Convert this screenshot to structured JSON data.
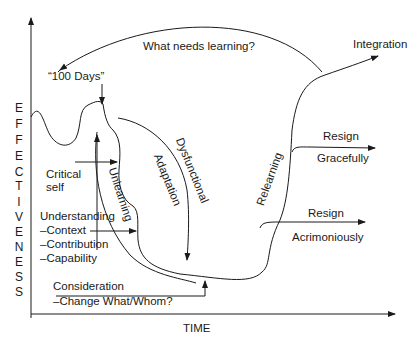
{
  "diagram": {
    "y_axis_label": [
      "E",
      "F",
      "F",
      "E",
      "C",
      "T",
      "I",
      "V",
      "E",
      "N",
      "E",
      "S",
      "S"
    ],
    "x_axis_label": "TIME",
    "top_arc_label": "What needs learning?",
    "start_label": "“100 Days”",
    "integration_label": "Integration",
    "resign_gracefully": {
      "line1": "Resign",
      "line2": "Gracefully"
    },
    "resign_acrimoniously": {
      "line1": "Resign",
      "line2": "Acrimoniously"
    },
    "critical_self": {
      "line1": "Critical",
      "line2": "self"
    },
    "understanding": {
      "title": "Understanding",
      "items": [
        "–Context",
        "–Contribution",
        "–Capability"
      ]
    },
    "consideration": {
      "title": "Consideration",
      "item": "–Change What/Whom?"
    },
    "curve_labels": {
      "unlearning": "Unlearning",
      "dysfunctional": "Dysfunctional",
      "adaptation": "Adaptation",
      "relearning": "Relearning"
    },
    "colors": {
      "line": "#1a1a1a",
      "background": "#ffffff"
    }
  }
}
